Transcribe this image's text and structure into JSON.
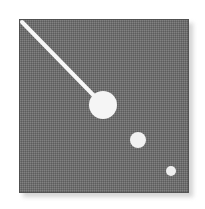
{
  "figure": {
    "canvas": {
      "width": 205,
      "height": 209,
      "background": "#ffffff"
    },
    "panel": {
      "name": "gray-field-panel",
      "x": 19,
      "y": 19,
      "width": 170,
      "height": 174,
      "fill": "#6e6e6e",
      "dither_light": "#8a8a8a",
      "dither_dark": "#5a5a5a",
      "border_color": "#4a4a4a",
      "shadow_color": "#cccccc",
      "shadow_offset": 4
    },
    "pointer_line": {
      "name": "diagonal-pointer-line",
      "x1": 22,
      "y1": 22,
      "x2": 103,
      "y2": 105,
      "stroke": "#f7f7f7",
      "stroke_width": 4
    },
    "objects": [
      {
        "name": "primary-object-marker",
        "label": "large",
        "cx": 103,
        "cy": 105,
        "r": 14,
        "fill": "#f5f5f5"
      },
      {
        "name": "secondary-object-marker",
        "label": "medium",
        "cx": 138,
        "cy": 140,
        "r": 8,
        "fill": "#f2f2f2"
      },
      {
        "name": "tertiary-object-marker",
        "label": "small",
        "cx": 171,
        "cy": 171,
        "r": 5,
        "fill": "#efefef"
      }
    ]
  }
}
